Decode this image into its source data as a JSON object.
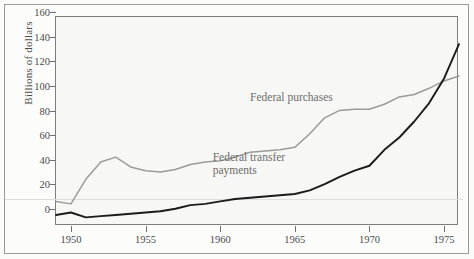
{
  "chart_data": {
    "type": "line",
    "title": "",
    "xlabel": "",
    "ylabel": "Billions of dollars",
    "xlim": [
      1949,
      1976
    ],
    "ylim": [
      0,
      170
    ],
    "ytick_values": [
      0,
      20,
      40,
      60,
      80,
      100,
      120,
      140,
      160
    ],
    "ytick_labels": [
      "0",
      "20",
      "40",
      "60",
      "80",
      "100",
      "120",
      "140",
      "160"
    ],
    "xtick_values": [
      1950,
      1955,
      1960,
      1965,
      1970,
      1975
    ],
    "xtick_labels": [
      "1950",
      "1955",
      "1960",
      "1965",
      "1970",
      "1975"
    ],
    "grid": false,
    "legend_position": "inline-annotations",
    "x": [
      1949,
      1950,
      1951,
      1952,
      1953,
      1954,
      1955,
      1956,
      1957,
      1958,
      1959,
      1960,
      1961,
      1962,
      1963,
      1964,
      1965,
      1966,
      1967,
      1968,
      1969,
      1970,
      1971,
      1972,
      1973,
      1974,
      1975,
      1976
    ],
    "series": [
      {
        "name": "Federal purchases",
        "color": "#9b9b9b",
        "values": [
          20,
          18,
          38,
          52,
          56,
          48,
          45,
          44,
          46,
          50,
          52,
          53,
          56,
          60,
          61,
          62,
          64,
          75,
          88,
          94,
          95,
          95,
          99,
          105,
          107,
          112,
          118,
          122
        ]
      },
      {
        "name": "Federal transfer payments",
        "color": "#1b1b1b",
        "values": [
          9,
          11,
          7,
          8,
          9,
          10,
          11,
          12,
          14,
          17,
          18,
          20,
          22,
          23,
          24,
          25,
          26,
          29,
          34,
          40,
          45,
          49,
          62,
          72,
          85,
          100,
          120,
          148
        ]
      }
    ],
    "annotations": [
      {
        "text": "Federal purchases",
        "x": 1962.0,
        "y": 104
      },
      {
        "text": "Federal transfer\npayments",
        "x": 1959.5,
        "y": 55
      }
    ]
  }
}
